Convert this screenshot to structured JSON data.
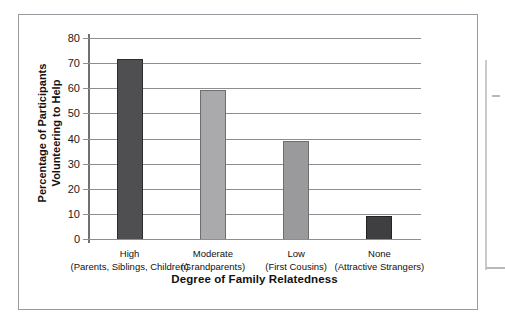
{
  "chart_data": {
    "type": "bar",
    "title": "",
    "xlabel": "Degree of Family Relatedness",
    "ylabel": "Percentage of Participants Volunteering to Help",
    "ylabel_lines": [
      "Percentage of Participants",
      "Volunteering to Help"
    ],
    "categories": [
      "High",
      "Moderate",
      "Low",
      "None"
    ],
    "category_sublabels": [
      "(Parents, Siblings, Children)",
      "(Grandparents)",
      "(First Cousins)",
      "(Attractive Strangers)"
    ],
    "values": [
      71.5,
      59.5,
      39,
      9
    ],
    "ylim": [
      0,
      80
    ],
    "ytick_values": [
      0,
      10,
      20,
      30,
      40,
      50,
      60,
      70,
      80
    ],
    "ytick_labels": [
      "0",
      "10",
      "20",
      "30",
      "40",
      "50",
      "60",
      "70",
      "80"
    ],
    "grid": true,
    "legend": "none",
    "bar_colors": [
      "#4f4f51",
      "#aaaaac",
      "#9a9a9c",
      "#3f3f41"
    ],
    "bar_edge_colors": [
      "#2e2e30",
      "#6e6e70",
      "#6e6e70",
      "#232325"
    ]
  },
  "figure": {
    "frame_color": "#9a9aa0",
    "axis_color": "#8d8d92",
    "background": "#ffffff"
  }
}
